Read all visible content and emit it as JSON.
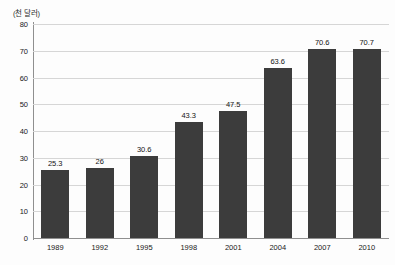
{
  "chart_data": {
    "type": "bar",
    "title": "",
    "subtitle": "",
    "unit_label": "(천 달러)",
    "xlabel": "",
    "ylabel": "",
    "categories": [
      "1989",
      "1992",
      "1995",
      "1998",
      "2001",
      "2004",
      "2007",
      "2010"
    ],
    "values": [
      25.3,
      26,
      30.6,
      43.3,
      47.5,
      63.6,
      70.6,
      70.7
    ],
    "value_labels": [
      "25.3",
      "26",
      "30.6",
      "43.3",
      "47.5",
      "63.6",
      "70.6",
      "70.7"
    ],
    "series": [
      {
        "name": "",
        "values": [
          25.3,
          26,
          30.6,
          43.3,
          47.5,
          63.6,
          70.6,
          70.7
        ]
      }
    ],
    "ylim": [
      0,
      80
    ],
    "ytick_labels": [
      "0",
      "10",
      "20",
      "30",
      "40",
      "50",
      "60",
      "70",
      "80"
    ],
    "ytick_values": [
      0,
      10,
      20,
      30,
      40,
      50,
      60,
      70,
      80
    ],
    "grid": true,
    "grid_axis": "y",
    "legend": false,
    "legend_position": "none",
    "colors": {
      "bar": "#3c3c3c",
      "gridline": "#d6d6d6",
      "axis": "#8f8f8f",
      "text": "#1a1a1a",
      "background": "#fdfdfd"
    }
  }
}
